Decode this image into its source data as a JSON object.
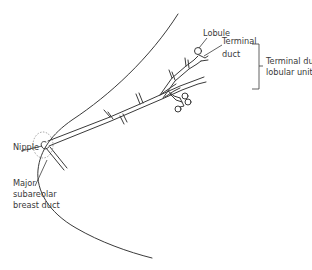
{
  "diagram": {
    "labels": {
      "lobule": "Lobule",
      "terminal_duct_line1": "Terminal",
      "terminal_duct_line2": "duct",
      "tdlu_line1": "Terminal duct",
      "tdlu_line2": "lobular unit",
      "nipple": "Nipple",
      "major_duct_line1": "Major",
      "major_duct_line2": "subareolar",
      "major_duct_line3": "breast duct"
    },
    "colors": {
      "line": "#3a3a3a",
      "areola_outline": "#8a8a8a",
      "background": "#ffffff"
    }
  }
}
